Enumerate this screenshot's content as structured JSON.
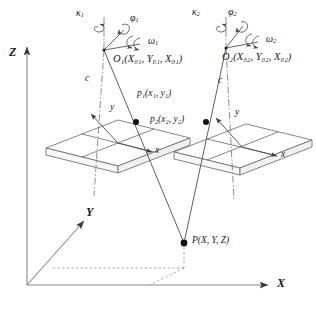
{
  "figure": {
    "type": "diagram",
    "background_color": "#ffffff",
    "line_color": "#555555",
    "text_color": "#1a1a1a"
  },
  "world_axes": {
    "x_label": "X",
    "y_label": "Y",
    "z_label": "Z"
  },
  "cameras": [
    {
      "id": "left",
      "center_label": "O",
      "center_sub": "1",
      "center_coords": "(X₀₁, Y₀₁, X₀₁)",
      "center_full": "O₁(X₀₁, Y₀₁, X₀₁)",
      "kappa_label": "κ",
      "kappa_sub": "1",
      "phi_label": "φ",
      "phi_sub": "1",
      "omega_label": "ω",
      "omega_sub": "1",
      "focal_label": "c",
      "image_x_label": "x",
      "image_y_label": "y"
    },
    {
      "id": "right",
      "center_label": "O",
      "center_sub": "2",
      "center_coords": "(X₀₂, Y₀₂, X₀₂)",
      "center_full": "O₂(X₀₂, Y₀₂, X₀₂)",
      "kappa_label": "κ",
      "kappa_sub": "2",
      "phi_label": "φ",
      "phi_sub": "2",
      "omega_label": "ω",
      "omega_sub": "2",
      "focal_label": "c",
      "image_x_label": "x",
      "image_y_label": "y"
    }
  ],
  "image_points": [
    {
      "id": "p1",
      "label": "p",
      "sub": "1",
      "coords": "(x₁, y₁)",
      "full": "p₁(x₁, y₁)"
    },
    {
      "id": "p2",
      "label": "p",
      "sub": "2",
      "coords": "(x₂, y₂)",
      "full": "p₂(x₂, y₂)"
    }
  ],
  "ground_point": {
    "label": "P",
    "coords": "(X, Y, Z)",
    "full": "P(X, Y, Z)"
  }
}
